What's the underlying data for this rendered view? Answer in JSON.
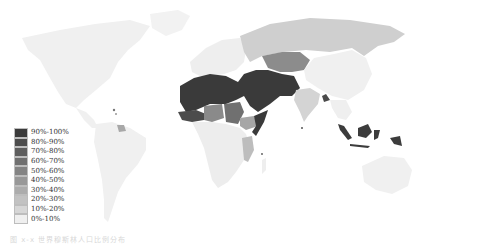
{
  "map": {
    "type": "choropleth",
    "style": "grayscale",
    "subject": "Share of population (percentage bins)",
    "legend": {
      "items": [
        {
          "label": "90%-100%",
          "color": "#3a3a3a"
        },
        {
          "label": "80%-90%",
          "color": "#4c4c4c"
        },
        {
          "label": "70%-80%",
          "color": "#5e5e5e"
        },
        {
          "label": "60%-70%",
          "color": "#707070"
        },
        {
          "label": "50%-60%",
          "color": "#848484"
        },
        {
          "label": "40%-50%",
          "color": "#989898"
        },
        {
          "label": "30%-40%",
          "color": "#acacac"
        },
        {
          "label": "20%-30%",
          "color": "#c2c2c2"
        },
        {
          "label": "10%-20%",
          "color": "#d6d6d6"
        },
        {
          "label": "0%-10%",
          "color": "#efefef"
        }
      ]
    },
    "regions": {
      "north_america": "#f0f0f0",
      "greenland": "#f2f2f2",
      "south_america": "#f0f0f0",
      "guyana_suriname": "#a8a8a8",
      "europe": "#eeeeee",
      "russia": "#cfcfcf",
      "kazakhstan_central_asia": "#8c8c8c",
      "north_africa_middle_east": "#3a3a3a",
      "sahel_west_africa": "#4c4c4c",
      "nigeria_chad": "#8a8a8a",
      "sudan": "#707070",
      "ethiopia": "#a6a6a6",
      "somalia": "#3a3a3a",
      "central_south_africa": "#ededed",
      "tanzania_mozambique": "#bdbdbd",
      "india": "#d4d4d4",
      "bangladesh": "#4a4a4a",
      "china": "#f0f0f0",
      "southeast_asia": "#efefef",
      "indonesia_malaysia": "#3c3c3c",
      "australia": "#f0f0f0"
    }
  },
  "caption": "图 x-x  世界穆斯林人口比例分布"
}
